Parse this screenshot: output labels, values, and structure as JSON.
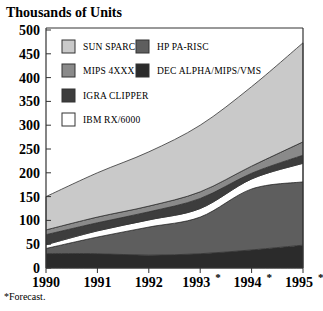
{
  "chart_data": {
    "type": "area",
    "stacked": true,
    "title": "Thousands of Units",
    "xlabel": "",
    "ylabel": "Thousands of Units",
    "categories": [
      "1990",
      "1991",
      "1992",
      "1993*",
      "1994*",
      "1995*"
    ],
    "ylim": [
      0,
      500
    ],
    "yticks": [
      0,
      50,
      100,
      150,
      200,
      250,
      300,
      350,
      400,
      450,
      500
    ],
    "grid": false,
    "legend_position": "upper-left inside plot",
    "stack_order_bottom_to_top": [
      "DEC ALPHA/MIPS/VMS",
      "HP PA-RISC",
      "IBM RX/6000",
      "IGRA CLIPPER",
      "MIPS 4XXX",
      "SUN SPARC"
    ],
    "series": [
      {
        "name": "DEC ALPHA/MIPS/VMS",
        "color": "#2b2b2b",
        "values": [
          30,
          30,
          27,
          30,
          38,
          48
        ]
      },
      {
        "name": "HP PA-RISC",
        "color": "#5e5e5e",
        "values": [
          11,
          35,
          59,
          77,
          128,
          133
        ]
      },
      {
        "name": "IBM RX/6000",
        "color": "#ffffff",
        "values": [
          8,
          13,
          15,
          18,
          21,
          39
        ]
      },
      {
        "name": "IGRA CLIPPER",
        "color": "#3d3d3d",
        "values": [
          21,
          17,
          17,
          21,
          12,
          17
        ]
      },
      {
        "name": "MIPS 4XXX",
        "color": "#8a8a8a",
        "values": [
          10,
          12,
          12,
          14,
          15,
          28
        ]
      },
      {
        "name": "SUN SPARC",
        "color": "#c9c9c9",
        "values": [
          70,
          93,
          114,
          140,
          167,
          208
        ]
      }
    ],
    "totals": [
      150,
      200,
      244,
      300,
      381,
      473
    ],
    "annotations": [
      "*Forecast."
    ]
  },
  "legend": {
    "items": [
      {
        "label": "SUN SPARC",
        "color": "#c9c9c9"
      },
      {
        "label": "HP PA-RISC",
        "color": "#5e5e5e"
      },
      {
        "label": "MIPS 4XXX",
        "color": "#8a8a8a"
      },
      {
        "label": "DEC ALPHA/MIPS/VMS",
        "color": "#2b2b2b"
      },
      {
        "label": "IGRA CLIPPER",
        "color": "#3d3d3d"
      },
      {
        "label": "IBM RX/6000",
        "color": "#ffffff"
      }
    ]
  },
  "footnote": "*Forecast."
}
